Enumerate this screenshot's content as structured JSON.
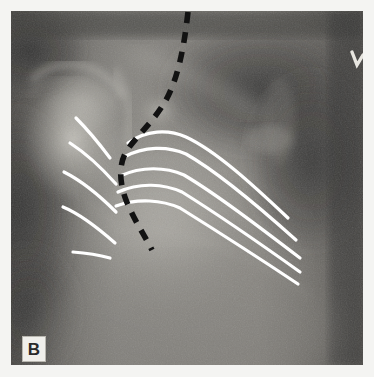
{
  "figure": {
    "panel_label": "B",
    "modality": "radiograph",
    "caption_visible": false
  },
  "colors": {
    "overlay_line": "#ffffff",
    "dashed_line": "#121212",
    "label_box_fill": "#f0efeb",
    "label_text": "#2a2a2a",
    "plate_background": "#6f6f6f",
    "page_background": "#f4f4f2",
    "lung_field_dark": "#3a3a3a",
    "bone_bright": "#cfcdc6"
  },
  "plate": {
    "x": 11,
    "y": 11,
    "width": 352,
    "height": 354
  },
  "annotations": {
    "solid_white_curves": {
      "name": "rib-contour-lines",
      "color": "#ffffff",
      "stroke_width": 3.2,
      "count": 10,
      "left_group": [
        {
          "id": "left-rib-1",
          "d": "M 76,118 C 86,128 98,142 110,158"
        },
        {
          "id": "left-rib-2",
          "d": "M 70,143 C 84,152 100,166 116,184"
        },
        {
          "id": "left-rib-3",
          "d": "M 64,172 C 80,180 98,194 116,212"
        },
        {
          "id": "left-rib-4",
          "d": "M 63,207 C 80,214 98,228 115,243"
        },
        {
          "id": "left-rib-5",
          "d": "M 73,252 C 86,253 99,255 110,258"
        }
      ],
      "right_group": [
        {
          "id": "right-rib-1",
          "d": "M 128,143 C 146,130 168,129 186,137 C 216,151 252,184 288,218"
        },
        {
          "id": "right-rib-2",
          "d": "M 124,157 C 144,146 168,146 186,154 C 218,172 258,206 296,240"
        },
        {
          "id": "right-rib-3",
          "d": "M 120,176 C 142,166 166,167 184,175 C 216,194 258,226 300,258"
        },
        {
          "id": "right-rib-4",
          "d": "M 118,192 C 140,182 164,184 182,192 C 214,212 258,242 300,272"
        },
        {
          "id": "right-rib-5",
          "d": "M 116,206 C 138,198 162,200 180,208 C 212,228 256,256 298,284"
        }
      ]
    },
    "dashed_black_curve": {
      "name": "scapular-border-dashed-line",
      "color": "#121212",
      "stroke_width": 5.5,
      "dash_pattern": "11 9",
      "d": "M 188,12 C 184,48 178,78 166,100 C 152,124 136,136 126,152 C 118,166 120,184 126,200 C 134,220 146,238 152,250"
    },
    "corner_marker": {
      "name": "side-marker-chevron",
      "color": "#e8e6e0",
      "x": 355,
      "y": 55
    }
  }
}
